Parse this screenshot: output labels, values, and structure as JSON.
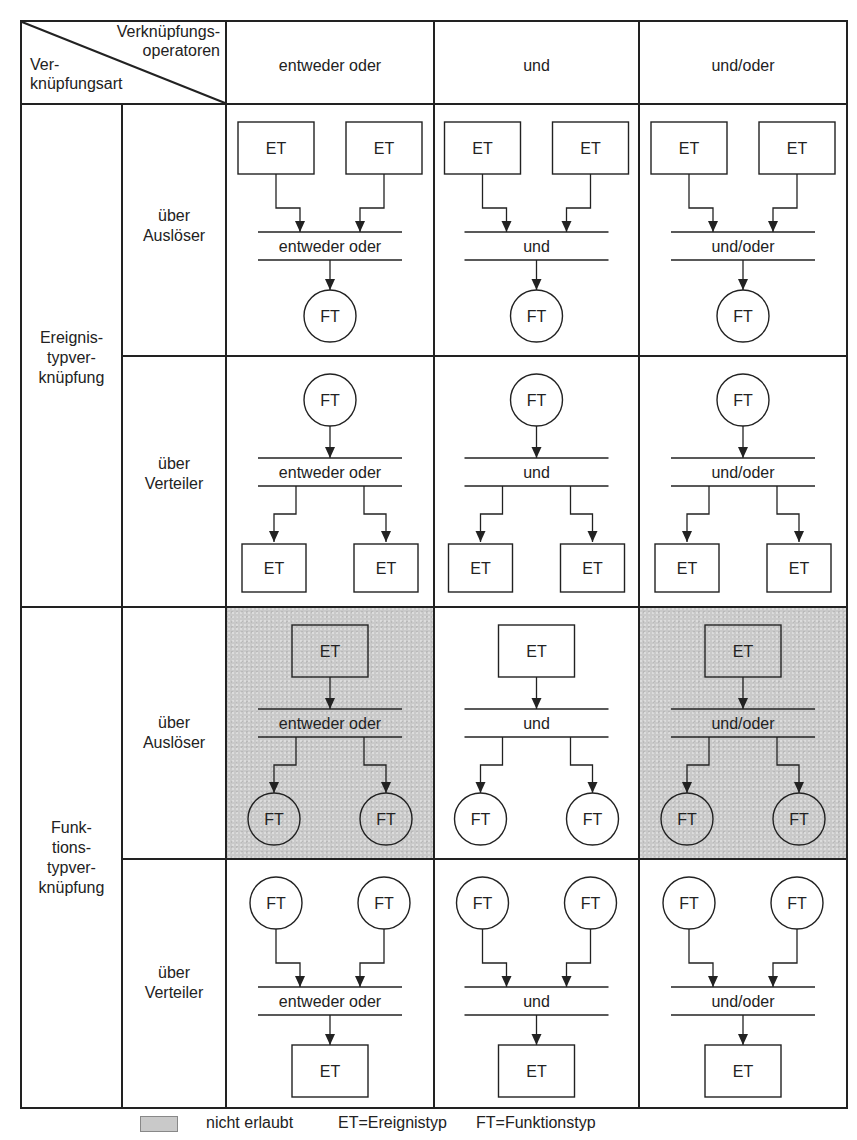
{
  "header": {
    "corner_top": [
      "Verknüpfungs-",
      "operatoren"
    ],
    "corner_bottom": [
      "Ver-",
      "knüpfungsart"
    ],
    "columns": [
      "entweder oder",
      "und",
      "und/oder"
    ]
  },
  "groups": [
    {
      "label": [
        "Ereignis-",
        "typver-",
        "knüpfung"
      ],
      "rows": [
        {
          "label": [
            "über",
            "Auslöser"
          ],
          "pattern": "merge",
          "top": "ET",
          "bottom": "FT"
        },
        {
          "label": [
            "über",
            "Verteiler"
          ],
          "pattern": "split",
          "top": "FT",
          "bottom": "ET"
        }
      ]
    },
    {
      "label": [
        "Funk-",
        "tions-",
        "typver-",
        "knüpfung"
      ],
      "rows": [
        {
          "label": [
            "über",
            "Auslöser"
          ],
          "pattern": "split",
          "top": "ET",
          "bottom": "FT"
        },
        {
          "label": [
            "über",
            "Verteiler"
          ],
          "pattern": "merge",
          "top": "FT",
          "bottom": "ET"
        }
      ]
    }
  ],
  "shaded_cells": [
    [
      2,
      0
    ],
    [
      2,
      2
    ]
  ],
  "legend": {
    "swatch_color": "#c9c9c9",
    "not_allowed": "nicht erlaubt",
    "et": "ET=Ereignistyp",
    "ft": "FT=Funktionstyp"
  },
  "colors": {
    "line": "#222222",
    "shade": "#c9c9c9",
    "background": "#ffffff"
  }
}
